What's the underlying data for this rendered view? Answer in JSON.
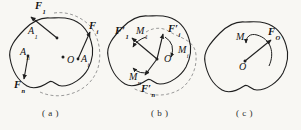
{
  "canvas": {
    "width": 301,
    "height": 130,
    "background": "#f8f7f3",
    "ink": "#1f1f1f",
    "dashed": "#8f8f8f"
  },
  "panels": {
    "a": {
      "caption": "( a )"
    },
    "b": {
      "caption": "( b )"
    },
    "c": {
      "caption": "( c )"
    }
  },
  "labels": {
    "a_F1": {
      "main": "F",
      "sub": "1"
    },
    "a_A1": {
      "main": "A",
      "sub": "1"
    },
    "a_Fi": {
      "main": "F",
      "sub": "i"
    },
    "a_Ai": {
      "main": "A",
      "sub": "i"
    },
    "a_An": {
      "main": "A",
      "sub": "n"
    },
    "a_Fn": {
      "main": "F",
      "sub": "n"
    },
    "a_O": {
      "main": "O",
      "sub": ""
    },
    "b_F1": {
      "main": "F′",
      "sub": "1"
    },
    "b_M1": {
      "main": "M",
      "sub": "1"
    },
    "b_Fi": {
      "main": "F′",
      "sub": "i"
    },
    "b_Mi": {
      "main": "M",
      "sub": "i"
    },
    "b_Mn": {
      "main": "M",
      "sub": "n"
    },
    "b_Fn": {
      "main": "F′",
      "sub": "n"
    },
    "b_O": {
      "main": "O",
      "sub": ""
    },
    "c_M": {
      "main": "M",
      "sub": ""
    },
    "c_FO": {
      "main": "F",
      "sub": "O"
    },
    "c_O": {
      "main": "O",
      "sub": ""
    }
  }
}
